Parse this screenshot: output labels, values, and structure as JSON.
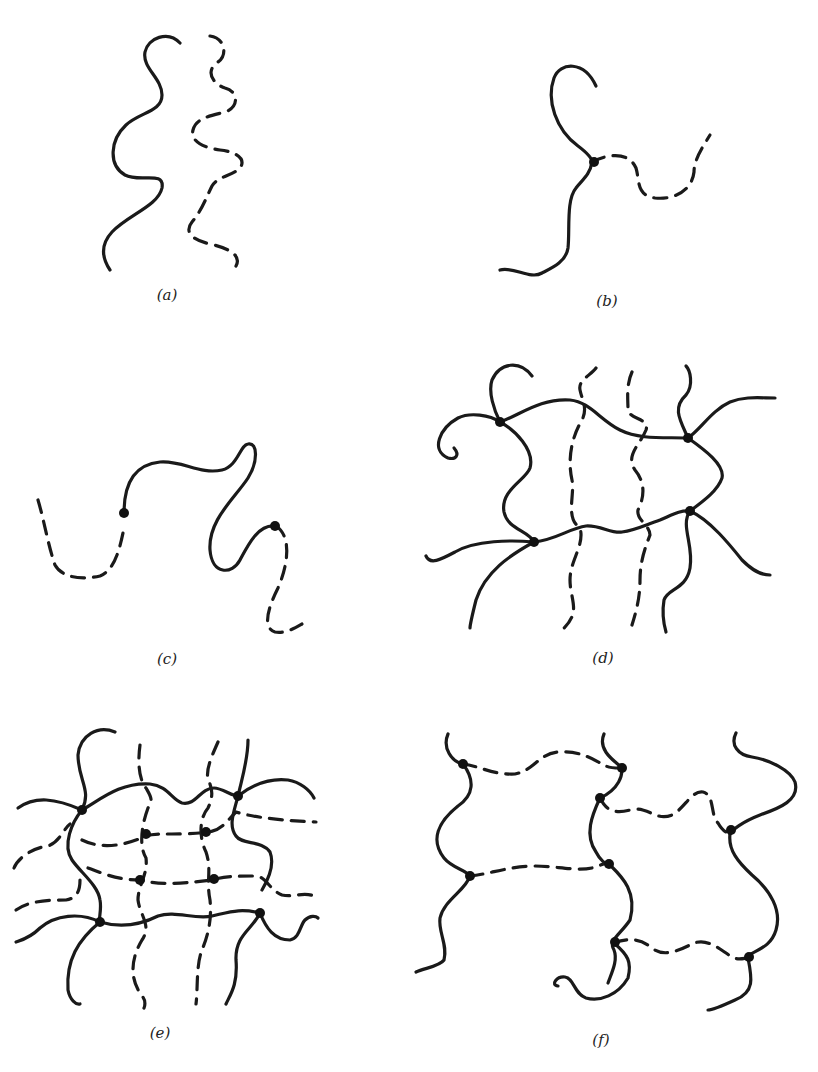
{
  "figure": {
    "colors": {
      "line": "#1a1a1a",
      "background": "#ffffff",
      "node": "#111111"
    },
    "panels": [
      {
        "id": "a",
        "label": "(a)",
        "content": "two separate uncrosslinked chains (one solid, one dashed)",
        "crosslinks": 0
      },
      {
        "id": "b",
        "label": "(b)",
        "content": "two chains joined at one crosslink (branched)",
        "crosslinks": 1
      },
      {
        "id": "c",
        "label": "(c)",
        "content": "linear chain extended by two junctions",
        "crosslinks": 2
      },
      {
        "id": "d",
        "label": "(d)",
        "content": "loose network of solid chains with dashed chains passing through",
        "crosslinks": 4
      },
      {
        "id": "e",
        "label": "(e)",
        "content": "dense network of solid and dashed chains",
        "crosslinks": 8
      },
      {
        "id": "f",
        "label": "(f)",
        "content": "solid chains bridged by dashed crosslink chains",
        "crosslinks": 8
      }
    ]
  }
}
